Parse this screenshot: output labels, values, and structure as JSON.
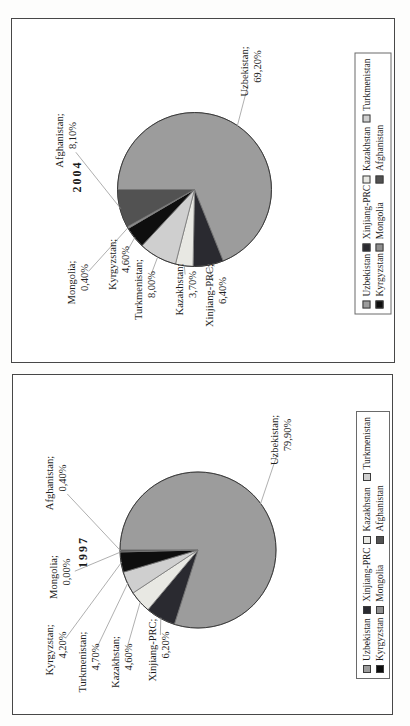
{
  "figure": {
    "units": "%",
    "decimal_separator": ","
  },
  "chart_data": [
    {
      "type": "pie",
      "title": "2004",
      "legend_position": "bottom",
      "start_angle_deg": 0,
      "direction": "clockwise",
      "slices": [
        {
          "name": "Uzbekistan",
          "label": "Uzbekistan;",
          "value": 69.2,
          "value_label": "69,20%",
          "color": "#9c9c9c"
        },
        {
          "name": "Xinjiang-PRC",
          "label": "Xinjiang-PRC;",
          "value": 6.4,
          "value_label": "6,40%",
          "color": "#2a2a30"
        },
        {
          "name": "Kazakhstan",
          "label": "Kazakhstan;",
          "value": 3.7,
          "value_label": "3,70%",
          "color": "#e8e8e3"
        },
        {
          "name": "Turkmenistan",
          "label": "Turkmenistan;",
          "value": 8.0,
          "value_label": "8,00%",
          "color": "#cfcfcf"
        },
        {
          "name": "Kyrgyzstan",
          "label": "Kyrgyzstan;",
          "value": 4.6,
          "value_label": "4,60%",
          "color": "#0e0e0e"
        },
        {
          "name": "Mongolia",
          "label": "Mongolia;",
          "value": 0.4,
          "value_label": "0,40%",
          "color": "#8f8f8f"
        },
        {
          "name": "Afghanistan",
          "label": "Afghanistan;",
          "value": 8.1,
          "value_label": "8,10%",
          "color": "#525252"
        }
      ],
      "legend_rows": [
        [
          "Uzbekistan",
          "Xinjiang-PRC",
          "Kazakhstan",
          "Turkmenistan"
        ],
        [
          "Kyrgyzstan",
          "Mongolia",
          "Afghanistan"
        ]
      ]
    },
    {
      "type": "pie",
      "title": "1997",
      "legend_position": "bottom",
      "start_angle_deg": 0,
      "direction": "clockwise",
      "slices": [
        {
          "name": "Uzbekistan",
          "label": "Uzbekistan;",
          "value": 79.9,
          "value_label": "79,90%",
          "color": "#9c9c9c"
        },
        {
          "name": "Xinjiang-PRC",
          "label": "Xinjiang-PRC;",
          "value": 6.2,
          "value_label": "6,20%",
          "color": "#2a2a30"
        },
        {
          "name": "Kazakhstan",
          "label": "Kazakhstan;",
          "value": 4.6,
          "value_label": "4,60%",
          "color": "#e8e8e3"
        },
        {
          "name": "Turkmenistan",
          "label": "Turkmenistan;",
          "value": 4.7,
          "value_label": "4,70%",
          "color": "#cfcfcf"
        },
        {
          "name": "Kyrgyzstan",
          "label": "Kyrgyzstan;",
          "value": 4.2,
          "value_label": "4,20%",
          "color": "#0e0e0e"
        },
        {
          "name": "Mongolia",
          "label": "Mongolia;",
          "value": 0.0,
          "value_label": "0,00%",
          "color": "#8f8f8f"
        },
        {
          "name": "Afghanistan",
          "label": "Afghanistan;",
          "value": 0.4,
          "value_label": "0,40%",
          "color": "#525252"
        }
      ],
      "legend_rows": [
        [
          "Uzbekistan",
          "Xinjiang-PRC",
          "Kazakhstan",
          "Turkmenistan"
        ],
        [
          "Kyrgyzstan",
          "Mongolia",
          "Afghanistan"
        ]
      ]
    }
  ]
}
